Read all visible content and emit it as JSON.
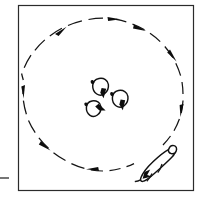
{
  "figure": {
    "caption_text": "",
    "width_px": 205,
    "height_px": 201,
    "background_color": "#ffffff",
    "ink_color": "#111111"
  },
  "frame": {
    "label": "arena-boundary-square",
    "x": 18,
    "y": 5,
    "width": 175,
    "height": 185,
    "stroke_color": "#2b2b2b",
    "stroke_width": 1.2
  },
  "left_tick": {
    "label": "axis-tick-mark",
    "x1": 0,
    "y1": 178,
    "x2": 9,
    "y2": 178
  },
  "circle_path": {
    "label": "dashed-circular-trajectory",
    "center_x": 103,
    "center_y": 98,
    "radius_x": 80,
    "radius_y": 80,
    "style": "dashed",
    "direction": "counter-clockwise",
    "dash_color": "#141414",
    "dash_count": 30
  },
  "path_arrows": [
    {
      "name": "path-arrow-top",
      "angle_deg": 270,
      "direction": "counter-clockwise"
    },
    {
      "name": "path-arrow-top-left",
      "angle_deg": 218,
      "direction": "counter-clockwise"
    },
    {
      "name": "path-arrow-left",
      "angle_deg": 170,
      "direction": "counter-clockwise"
    },
    {
      "name": "path-arrow-lower-left",
      "angle_deg": 128,
      "direction": "counter-clockwise"
    },
    {
      "name": "path-arrow-bottom",
      "angle_deg": 86,
      "direction": "counter-clockwise"
    },
    {
      "name": "path-arrow-right-lower",
      "angle_deg": 40,
      "direction": "counter-clockwise"
    },
    {
      "name": "path-arrow-right",
      "angle_deg": 352,
      "direction": "counter-clockwise"
    },
    {
      "name": "path-arrow-top-right",
      "angle_deg": 318,
      "direction": "counter-clockwise"
    }
  ],
  "flock": {
    "label": "sheep-flock-cluster",
    "count": 3,
    "members": [
      {
        "name": "sheep-1",
        "x": 100,
        "y": 88,
        "size": 11,
        "heading_deg": 105,
        "heading_label": "down"
      },
      {
        "name": "sheep-2",
        "x": 119,
        "y": 100,
        "size": 11,
        "heading_deg": 100,
        "heading_label": "down"
      },
      {
        "name": "sheep-3",
        "x": 93,
        "y": 110,
        "size": 10,
        "heading_deg": 55,
        "heading_label": "down-right"
      }
    ]
  },
  "herder": {
    "name": "shepherd-dog",
    "x": 157,
    "y": 164,
    "length": 34,
    "width": 12,
    "heading_deg": 218,
    "heading_label": "up-right-along-circle",
    "on_path": true
  }
}
